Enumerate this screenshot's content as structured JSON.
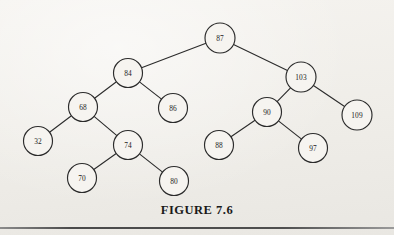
{
  "figure": {
    "caption": "FIGURE 7.6",
    "background_color": "#f2f0ec",
    "ink_color": "#2b2b2b",
    "node_fill_color": "#f6f4f0",
    "rule_color": "#4a4a4a"
  },
  "chart_data": {
    "type": "diagram",
    "diagram_kind": "binary-search-tree",
    "title": "FIGURE 7.6",
    "xlabel": "",
    "ylabel": "",
    "grid": false,
    "legend": "none",
    "node_radius": 14.5,
    "nodes": [
      {
        "id": "n87",
        "label": "87",
        "x": 220,
        "y": 38,
        "r": 15.0,
        "level": 0
      },
      {
        "id": "n84",
        "label": "84",
        "x": 128,
        "y": 73,
        "r": 14.5,
        "level": 1
      },
      {
        "id": "n103",
        "label": "103",
        "x": 301,
        "y": 77,
        "r": 15.0,
        "level": 1
      },
      {
        "id": "n68",
        "label": "68",
        "x": 83,
        "y": 107,
        "r": 14.5,
        "level": 2
      },
      {
        "id": "n86",
        "label": "86",
        "x": 173,
        "y": 108,
        "r": 14.5,
        "level": 2
      },
      {
        "id": "n90",
        "label": "90",
        "x": 267,
        "y": 112,
        "r": 14.5,
        "level": 2
      },
      {
        "id": "n109",
        "label": "109",
        "x": 357,
        "y": 115,
        "r": 15.0,
        "level": 2
      },
      {
        "id": "n32",
        "label": "32",
        "x": 38,
        "y": 141,
        "r": 14.5,
        "level": 3
      },
      {
        "id": "n74",
        "label": "74",
        "x": 128,
        "y": 145,
        "r": 14.5,
        "level": 3
      },
      {
        "id": "n88",
        "label": "88",
        "x": 219,
        "y": 145,
        "r": 14.5,
        "level": 3
      },
      {
        "id": "n97",
        "label": "97",
        "x": 313,
        "y": 148,
        "r": 14.5,
        "level": 3
      },
      {
        "id": "n70",
        "label": "70",
        "x": 82,
        "y": 178,
        "r": 14.5,
        "level": 4
      },
      {
        "id": "n80",
        "label": "80",
        "x": 174,
        "y": 181,
        "r": 14.5,
        "level": 4
      }
    ],
    "edges": [
      {
        "from": "n87",
        "to": "n84",
        "side": "left"
      },
      {
        "from": "n87",
        "to": "n103",
        "side": "right"
      },
      {
        "from": "n84",
        "to": "n68",
        "side": "left"
      },
      {
        "from": "n84",
        "to": "n86",
        "side": "right"
      },
      {
        "from": "n68",
        "to": "n32",
        "side": "left"
      },
      {
        "from": "n68",
        "to": "n74",
        "side": "right"
      },
      {
        "from": "n74",
        "to": "n70",
        "side": "left"
      },
      {
        "from": "n74",
        "to": "n80",
        "side": "right"
      },
      {
        "from": "n103",
        "to": "n90",
        "side": "left"
      },
      {
        "from": "n103",
        "to": "n109",
        "side": "right"
      },
      {
        "from": "n90",
        "to": "n88",
        "side": "left"
      },
      {
        "from": "n90",
        "to": "n97",
        "side": "right"
      }
    ]
  }
}
